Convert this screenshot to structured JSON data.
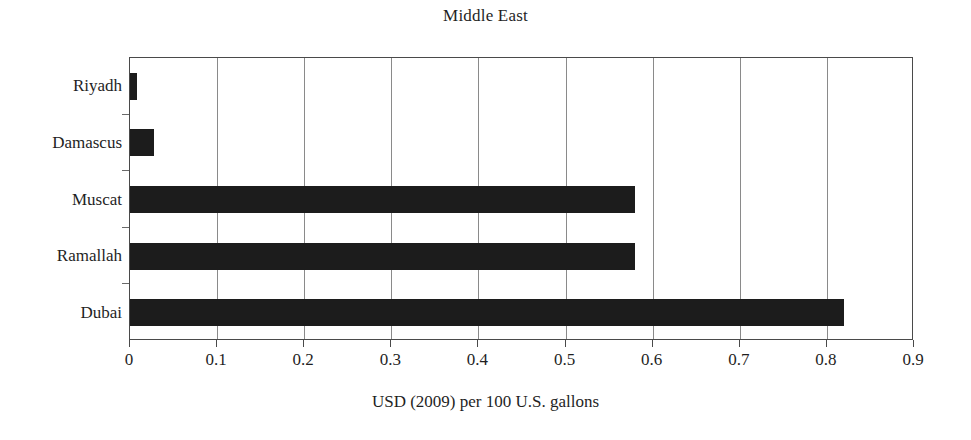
{
  "chart_data": {
    "type": "bar",
    "orientation": "horizontal",
    "title": "Middle East",
    "xlabel": "USD (2009) per 100 U.S. gallons",
    "ylabel": "",
    "categories": [
      "Riyadh",
      "Damascus",
      "Muscat",
      "Ramallah",
      "Dubai"
    ],
    "values": [
      0.008,
      0.028,
      0.58,
      0.58,
      0.82
    ],
    "xlim": [
      0,
      0.9
    ],
    "xticks": [
      0,
      0.1,
      0.2,
      0.3,
      0.4,
      0.5,
      0.6,
      0.7,
      0.8,
      0.9
    ],
    "xtick_labels": [
      "0",
      "0.1",
      "0.2",
      "0.3",
      "0.4",
      "0.5",
      "0.6",
      "0.7",
      "0.8",
      "0.9"
    ],
    "grid": "vertical",
    "legend": "none",
    "bar_color": "#1c1c1c",
    "plot_background": "#ffffff",
    "gridline_color": "#8a8a8a",
    "axis_color": "#4a4a4a",
    "series": [
      {
        "name": "USD (2009) per 100 U.S. gallons",
        "points": [
          {
            "category": "Riyadh",
            "value": 0.008
          },
          {
            "category": "Damascus",
            "value": 0.028
          },
          {
            "category": "Muscat",
            "value": 0.58
          },
          {
            "category": "Ramallah",
            "value": 0.58
          },
          {
            "category": "Dubai",
            "value": 0.82
          }
        ]
      }
    ]
  }
}
